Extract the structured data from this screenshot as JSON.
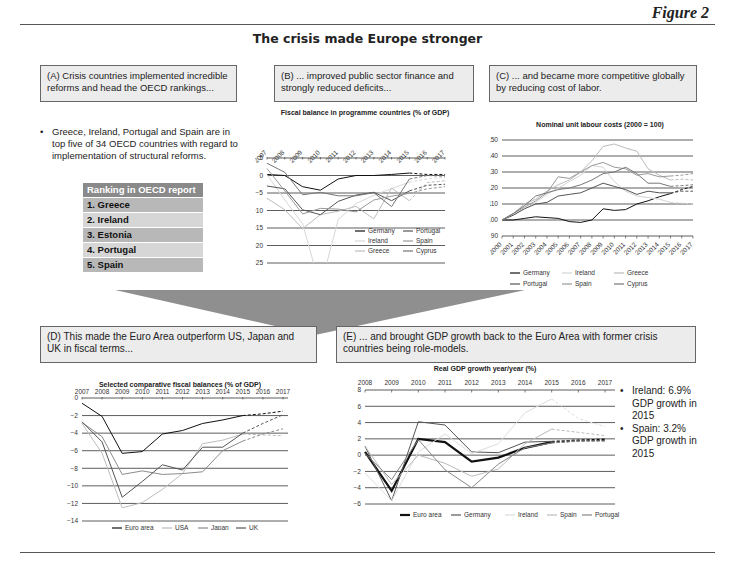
{
  "header": {
    "figure_label": "Figure 2",
    "title": "The crisis made Europe stronger"
  },
  "panels": {
    "A": {
      "caption": "(A) Crisis countries implemented incredible reforms and head the OECD rankings...",
      "bullet": "Greece, Ireland, Portugal and Spain are in top five of 34 OECD countries with regard to implementation of structural reforms.",
      "table_header": "Ranking in OECD report",
      "ranking": [
        "1. Greece",
        "2. Ireland",
        "3. Estonia",
        "4. Portugal",
        "5. Spain"
      ]
    },
    "B": {
      "caption": "(B) ... improved public sector finance and strongly reduced deficits..."
    },
    "C": {
      "caption": "(C) ... and became more competitive globally by reducing cost of labor."
    },
    "D": {
      "caption": "(D) This made the Euro Area outperform US, Japan and UK in fiscal terms..."
    },
    "E": {
      "caption": "(E) ... and brought GDP growth back to the Euro Area with former crisis countries being role-models.",
      "bullets": [
        "Ireland: 6.9% GDP growth in 2015",
        "Spain: 3.2% GDP growth in 2015"
      ]
    }
  },
  "chart_data": [
    {
      "id": "B",
      "type": "line",
      "title": "Fiscal balance in programme countries (% of GDP)",
      "categories": [
        "2007",
        "2008",
        "2009",
        "2010",
        "2011",
        "2012",
        "2013",
        "2014",
        "2015",
        "2016",
        "2017"
      ],
      "ylim": [
        -25,
        5
      ],
      "yticks": [
        5,
        0,
        -5,
        -10,
        -15,
        -20,
        -25
      ],
      "grid": true,
      "legend_position": "inside-bottom-right",
      "forecast_from": "2015",
      "series": [
        {
          "name": "Germany",
          "color": "#111111",
          "values": [
            0.3,
            0,
            -3.2,
            -4.2,
            -1.0,
            0,
            0,
            0.3,
            0.7,
            0.3,
            0.3
          ]
        },
        {
          "name": "Ireland",
          "color": "#d8d8d8",
          "values": [
            0.3,
            -7.0,
            -13.8,
            -32.0,
            -12.6,
            -8.0,
            -5.7,
            -3.7,
            -1.9,
            -1.0,
            -0.5
          ]
        },
        {
          "name": "Greece",
          "color": "#bdbdbd",
          "values": [
            -6.5,
            -9.8,
            -15.2,
            -11.2,
            -10.2,
            -8.8,
            -12.4,
            -3.6,
            -7.2,
            -2.0,
            -1.5
          ]
        },
        {
          "name": "Portugal",
          "color": "#555555",
          "values": [
            -3.0,
            -3.8,
            -9.8,
            -11.2,
            -7.4,
            -5.6,
            -4.8,
            -7.2,
            -4.4,
            -2.8,
            -2.5
          ]
        },
        {
          "name": "Spain",
          "color": "#999999",
          "values": [
            2.0,
            -4.4,
            -11.0,
            -9.4,
            -9.6,
            -10.4,
            -7.0,
            -5.9,
            -5.1,
            -3.8,
            -3.2
          ]
        },
        {
          "name": "Cyprus",
          "color": "#777777",
          "values": [
            3.5,
            0.9,
            -5.5,
            -4.8,
            -5.8,
            -5.8,
            -4.9,
            -8.9,
            -1.0,
            0,
            -0.2
          ]
        }
      ]
    },
    {
      "id": "C",
      "type": "line",
      "title": "Nominal unit labour costs (2000 = 100)",
      "categories": [
        "2000",
        "2001",
        "2002",
        "2003",
        "2004",
        "2005",
        "2006",
        "2007",
        "2008",
        "2009",
        "2010",
        "2011",
        "2012",
        "2013",
        "2014",
        "2015",
        "2016",
        "2017"
      ],
      "ylim": [
        90,
        150
      ],
      "yticks": [
        150,
        140,
        130,
        120,
        110,
        100,
        90
      ],
      "grid": true,
      "legend_position": "bottom",
      "forecast_from": "2015",
      "series": [
        {
          "name": "Germany",
          "color": "#111111",
          "values": [
            100,
            100,
            101,
            102,
            101.5,
            101,
            99,
            98.5,
            100,
            107,
            106,
            106.5,
            110,
            112,
            114.5,
            116.5,
            119,
            121
          ]
        },
        {
          "name": "Ireland",
          "color": "#d4d4d4",
          "values": [
            100,
            103,
            107,
            111,
            116,
            120,
            124,
            128,
            134,
            133,
            124,
            118,
            115,
            114,
            113,
            111,
            110.5,
            110
          ]
        },
        {
          "name": "Greece",
          "color": "#bbbbbb",
          "values": [
            100,
            104,
            110,
            113,
            118,
            122,
            125,
            130,
            137,
            146,
            147.5,
            145,
            143,
            132,
            128,
            125,
            125.5,
            125
          ]
        },
        {
          "name": "Portugal",
          "color": "#555555",
          "values": [
            100,
            103,
            107,
            110,
            111,
            115,
            116,
            117,
            120,
            123,
            121,
            119,
            116,
            118,
            117,
            117,
            118,
            118
          ]
        },
        {
          "name": "Spain",
          "color": "#999999",
          "values": [
            100,
            104,
            108,
            112,
            117,
            127,
            126,
            130,
            134,
            136,
            133,
            132,
            128,
            129,
            127,
            127.5,
            128,
            129
          ]
        },
        {
          "name": "Cyprus",
          "color": "#777777",
          "values": [
            100,
            104,
            109,
            115,
            117,
            119,
            120,
            122,
            125,
            129,
            130,
            133,
            129,
            123,
            123,
            121,
            121.5,
            122
          ]
        }
      ]
    },
    {
      "id": "D",
      "type": "line",
      "title": "Selected comparative fiscal balances (% of GDP)",
      "categories": [
        "2007",
        "2008",
        "2009",
        "2010",
        "2011",
        "2012",
        "2013",
        "2014",
        "2015",
        "2016",
        "2017"
      ],
      "ylim": [
        -14,
        0
      ],
      "yticks": [
        0,
        -2,
        -4,
        -6,
        -8,
        -10,
        -12,
        -14
      ],
      "grid": true,
      "legend_position": "bottom",
      "forecast_from": "2015",
      "series": [
        {
          "name": "Euro area",
          "color": "#111111",
          "values": [
            -0.6,
            -2.1,
            -6.3,
            -6.1,
            -4.1,
            -3.7,
            -2.9,
            -2.5,
            -2.0,
            -1.8,
            -1.5
          ]
        },
        {
          "name": "USA",
          "color": "#bdbdbd",
          "values": [
            -2.9,
            -6.3,
            -12.5,
            -11.9,
            -10.4,
            -8.6,
            -5.2,
            -4.8,
            -4.1,
            -4.2,
            -4.3
          ]
        },
        {
          "name": "Japan",
          "color": "#8c8c8c",
          "values": [
            -2.8,
            -4.4,
            -8.7,
            -8.3,
            -8.7,
            -8.6,
            -8.4,
            -6.0,
            -4.9,
            -4.1,
            -3.5
          ]
        },
        {
          "name": "UK",
          "color": "#555555",
          "values": [
            -2.7,
            -5.0,
            -11.3,
            -9.5,
            -7.6,
            -8.2,
            -5.6,
            -5.6,
            -4.0,
            -2.9,
            -1.9
          ]
        }
      ]
    },
    {
      "id": "E",
      "type": "line",
      "title": "Real GDP growth year/year (%)",
      "categories": [
        "2008",
        "2009",
        "2010",
        "2011",
        "2012",
        "2013",
        "2014",
        "2015",
        "2016",
        "2017"
      ],
      "ylim": [
        -6,
        8
      ],
      "yticks": [
        8,
        6,
        4,
        2,
        0,
        -2,
        -4,
        -6
      ],
      "grid": true,
      "legend_position": "bottom",
      "forecast_from": "2015",
      "series": [
        {
          "name": "Euro area",
          "color": "#111111",
          "values": [
            0.4,
            -4.4,
            2.0,
            1.6,
            -0.8,
            -0.3,
            0.9,
            1.6,
            1.8,
            1.9
          ]
        },
        {
          "name": "Germany",
          "color": "#555555",
          "values": [
            1.1,
            -5.6,
            4.1,
            3.7,
            0.4,
            0.3,
            1.6,
            1.7,
            1.8,
            1.8
          ]
        },
        {
          "name": "Ireland",
          "color": "#dddddd",
          "values": [
            -2.2,
            -5.6,
            0.4,
            2.6,
            0.2,
            1.4,
            5.2,
            6.9,
            4.5,
            3.5
          ]
        },
        {
          "name": "Spain",
          "color": "#bbbbbb",
          "values": [
            1.1,
            -3.6,
            0.0,
            -1.0,
            -2.6,
            -1.7,
            1.4,
            3.2,
            2.8,
            2.4
          ]
        },
        {
          "name": "Portugal",
          "color": "#888888",
          "values": [
            0.2,
            -3.0,
            1.9,
            -1.8,
            -4.0,
            -1.1,
            0.9,
            1.5,
            1.7,
            1.7
          ]
        }
      ]
    }
  ]
}
